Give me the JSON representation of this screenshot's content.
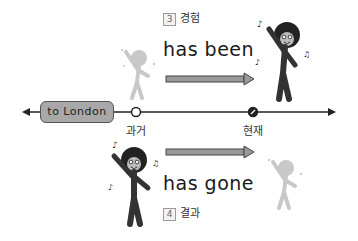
{
  "top": {
    "number": "3",
    "label": "경험",
    "phrase": "has been"
  },
  "bottom": {
    "number": "4",
    "label": "결과",
    "phrase": "has gone"
  },
  "timeline": {
    "destination": "to London",
    "past_label": "과거",
    "present_label": "현재"
  },
  "colors": {
    "line": "#222222",
    "arrow_fill": "#9a9a9a",
    "ghost": "#c8c8c8",
    "london_box": "#a8a8a8"
  }
}
